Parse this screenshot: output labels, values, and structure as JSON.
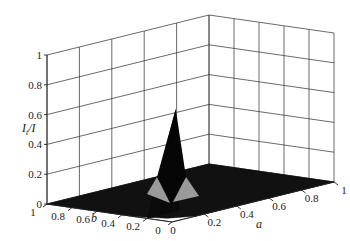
{
  "chart_data": {
    "type": "surface3d",
    "title": "",
    "xlabel": "a",
    "ylabel": "b",
    "zlabel": "I_t/I",
    "xlim": [
      0,
      1
    ],
    "ylim": [
      0,
      1
    ],
    "zlim": [
      0,
      1
    ],
    "x_ticks": [
      "0",
      "0.2",
      "0.4",
      "0.6",
      "0.8",
      "1"
    ],
    "y_ticks": [
      "0",
      "0.2",
      "0.4",
      "0.6",
      "0.8",
      "1"
    ],
    "z_ticks": [
      "0",
      "0.2",
      "0.4",
      "0.6",
      "0.8",
      "1"
    ],
    "grid": true,
    "surface": {
      "description": "Near-zero flat surface over the a-b plane with a single sharp peak near a=0.1, b=0.1",
      "peak": {
        "a": 0.1,
        "b": 0.1,
        "value": 0.72
      },
      "baseline_value": 0.0,
      "colors": {
        "surface": "#111111",
        "facets_lit": "#9a9a9a"
      }
    }
  },
  "labels": {
    "z_axis_main": "I",
    "z_axis_sub": "t",
    "z_axis_tail": "/I",
    "x_axis": "a",
    "y_axis": "b"
  }
}
